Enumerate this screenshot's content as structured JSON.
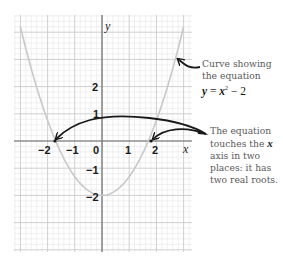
{
  "chart_data": {
    "type": "line",
    "title": "",
    "xlabel": "x",
    "ylabel": "y",
    "xlim": [
      -3.3,
      3.3
    ],
    "ylim": [
      -4.1,
      4.6
    ],
    "grid": true,
    "x_ticks": [
      -2,
      -1,
      0,
      1,
      2
    ],
    "y_ticks": [
      2,
      1,
      0,
      -1,
      -2
    ],
    "x_tick_labels": [
      "−2",
      "−1",
      "0",
      "1",
      "2"
    ],
    "y_tick_labels": [
      "2",
      "1",
      "−1",
      "−2"
    ],
    "origin_label": "0",
    "series": [
      {
        "name": "y = x² − 2",
        "x": [
          -3.0,
          -2.5,
          -2.0,
          -1.75,
          -1.5,
          -1.0,
          -0.5,
          0,
          0.5,
          1.0,
          1.5,
          1.75,
          2.0,
          2.5,
          3.0
        ],
        "y": [
          4.2,
          2.6,
          1.1,
          0,
          -0.6,
          -1.4,
          -1.85,
          -2.0,
          -1.85,
          -1.4,
          -0.6,
          0,
          1.1,
          2.6,
          4.2
        ],
        "color": "#c8c8c8"
      }
    ],
    "roots": [
      -1.75,
      1.75
    ],
    "annotations": [
      {
        "text": "Curve showing the equation y = x² − 2",
        "points_to": "curve"
      },
      {
        "text": "The equation touches the x axis in two places: it has two real roots.",
        "points_to": [
          "root-left",
          "root-right"
        ]
      }
    ]
  },
  "labels": {
    "x_axis": "x",
    "y_axis": "y",
    "ticks_x": {
      "m2": "−2",
      "m1": "−1",
      "zero": "0",
      "p1": "1",
      "p2": "2"
    },
    "ticks_y": {
      "p2": "2",
      "p1": "1",
      "m1": "−1",
      "m2": "−2"
    }
  },
  "annotation_curve": {
    "line1": "Curve showing",
    "line2": "the equation",
    "eq_y": "y",
    "eq_eq": " = ",
    "eq_x": "x",
    "eq_sup": "2",
    "eq_rest": " − 2"
  },
  "annotation_roots": {
    "line1": "The equation",
    "line2_a": "touches the ",
    "line2_var": "x",
    "line3": "axis in two",
    "line4": "places: it has",
    "line5": "two real roots."
  },
  "colors": {
    "curve": "#c8c8c8",
    "axis": "#707070",
    "grid_major": "#c9c9c9",
    "grid_minor": "#e6e6e6",
    "arrow": "#1a1a1a"
  }
}
